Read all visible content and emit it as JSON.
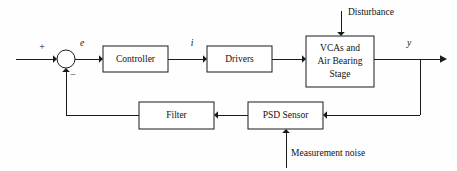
{
  "diagram": {
    "type": "control-system-block-diagram",
    "background_color": "#fefefe",
    "line_color": "#1a1a1a",
    "text_color": "#111111",
    "blocks": [
      {
        "id": "controller",
        "label": "Controller",
        "lines": [
          "Controller"
        ],
        "x": 103,
        "y": 46,
        "w": 65,
        "h": 26
      },
      {
        "id": "drivers",
        "label": "Drivers",
        "lines": [
          "Drivers"
        ],
        "x": 207,
        "y": 46,
        "w": 65,
        "h": 26
      },
      {
        "id": "plant",
        "label": "VCAs and Air Bearing Stage",
        "lines": [
          "VCAs and",
          "Air Bearing",
          "Stage"
        ],
        "x": 306,
        "y": 36,
        "w": 68,
        "h": 51
      },
      {
        "id": "filter",
        "label": "Filter",
        "lines": [
          "Filter"
        ],
        "x": 139,
        "y": 102,
        "w": 75,
        "h": 27
      },
      {
        "id": "sensor",
        "label": "PSD Sensor",
        "lines": [
          "PSD Sensor"
        ],
        "x": 248,
        "y": 102,
        "w": 75,
        "h": 27
      }
    ],
    "summing_junction": {
      "id": "summing-junction",
      "cx": 66,
      "cy": 59,
      "r": 9,
      "plus_sign": "+",
      "minus_sign": "−"
    },
    "signal_labels": [
      {
        "id": "error-signal",
        "text": "e",
        "x": 82,
        "y": 44,
        "italic": true
      },
      {
        "id": "current-signal",
        "text": "i",
        "x": 192,
        "y": 44,
        "italic": true
      },
      {
        "id": "output-signal",
        "text": "y",
        "x": 409,
        "y": 44,
        "italic": true
      }
    ],
    "external_labels": [
      {
        "id": "disturbance",
        "text": "Disturbance",
        "x": 348,
        "y": 13
      },
      {
        "id": "measurement-noise",
        "text": "Measurement noise",
        "x": 291,
        "y": 154
      }
    ]
  }
}
